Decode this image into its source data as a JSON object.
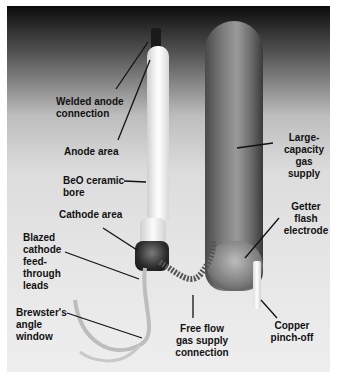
{
  "figure": {
    "labels": [
      {
        "id": "welded-anode",
        "text": "Welded anode\nconnection"
      },
      {
        "id": "anode-area",
        "text": "Anode area"
      },
      {
        "id": "beo-bore",
        "text": "BeO ceramic\nbore"
      },
      {
        "id": "cathode-area",
        "text": "Cathode area"
      },
      {
        "id": "blazed-cathode",
        "text": "Blazed\ncathode\nfeed-\nthrough\nleads"
      },
      {
        "id": "brewster-window",
        "text": "Brewster's\nangle\nwindow"
      },
      {
        "id": "gas-supply-connection",
        "text": "Free flow\ngas supply\nconnection"
      },
      {
        "id": "large-capacity",
        "text": "Large-\ncapacity\ngas\nsupply"
      },
      {
        "id": "getter-flash",
        "text": "Getter\nflash\nelectrode"
      },
      {
        "id": "copper-pinch",
        "text": "Copper\npinch-off"
      }
    ]
  }
}
